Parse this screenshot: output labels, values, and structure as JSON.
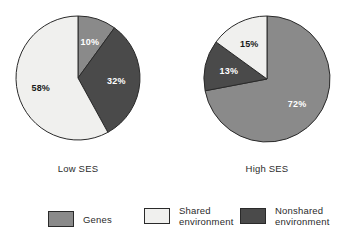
{
  "chart_data": {
    "type": "pie",
    "title": "",
    "subtitle": "",
    "xlabel": "",
    "ylabel": "",
    "legend_position": "bottom",
    "grid": false,
    "categories": [
      "Genes",
      "Shared environment",
      "Nonshared environment"
    ],
    "colors": {
      "genes": "#8a8a8a",
      "shared_environment": "#f0f0ee",
      "nonshared_environment": "#4a4a4a",
      "outline": "#2a2a2a",
      "background": "#ffffff"
    },
    "charts": [
      {
        "name": "low-ses",
        "label": "Low SES",
        "slices": [
          {
            "category": "Genes",
            "value": 10,
            "display": "10%",
            "color_key": "genes",
            "label_color": "#ffffff"
          },
          {
            "category": "Nonshared environment",
            "value": 32,
            "display": "32%",
            "color_key": "nonshared_environment",
            "label_color": "#ffffff"
          },
          {
            "category": "Shared environment",
            "value": 58,
            "display": "58%",
            "color_key": "shared_environment",
            "label_color": "#1a1a1a"
          }
        ]
      },
      {
        "name": "high-ses",
        "label": "High SES",
        "slices": [
          {
            "category": "Genes",
            "value": 72,
            "display": "72%",
            "color_key": "genes",
            "label_color": "#ffffff"
          },
          {
            "category": "Nonshared environment",
            "value": 13,
            "display": "13%",
            "color_key": "nonshared_environment",
            "label_color": "#ffffff"
          },
          {
            "category": "Shared environment",
            "value": 15,
            "display": "15%",
            "color_key": "shared_environment",
            "label_color": "#1a1a1a"
          }
        ]
      }
    ]
  },
  "legend": {
    "items": [
      {
        "label": "Genes",
        "color_key": "genes"
      },
      {
        "label": "Shared\nenvironment",
        "color_key": "shared_environment"
      },
      {
        "label": "Nonshared\nenvironment",
        "color_key": "nonshared_environment"
      }
    ]
  },
  "geometry": {
    "pies": [
      {
        "cx": 78,
        "cy": 78,
        "r": 62,
        "start_angle": 0
      },
      {
        "cx": 267,
        "cy": 79,
        "r": 63,
        "start_angle": 0
      }
    ],
    "label_radius_factor": 0.62
  }
}
